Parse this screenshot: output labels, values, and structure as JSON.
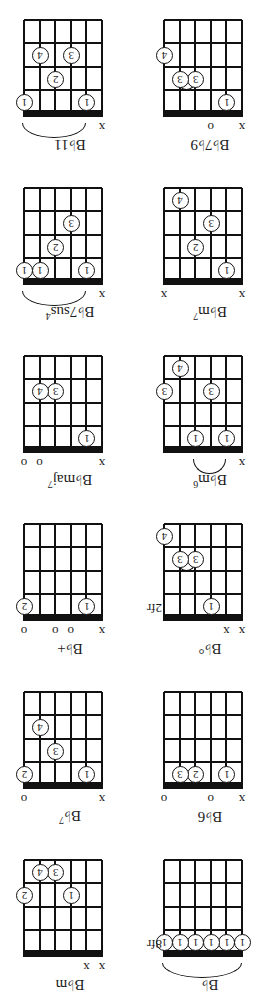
{
  "chords": [
    {
      "name": "B♭",
      "sup": "",
      "fret_label": "8fr",
      "marks": [
        "",
        "",
        "",
        "",
        "",
        ""
      ],
      "dots": [
        {
          "s": 6,
          "f": 1,
          "n": "1"
        },
        {
          "s": 5,
          "f": 1,
          "n": "1"
        },
        {
          "s": 4,
          "f": 1,
          "n": "1"
        },
        {
          "s": 3,
          "f": 1,
          "n": "1"
        },
        {
          "s": 2,
          "f": 1,
          "n": "1"
        },
        {
          "s": 1,
          "f": 1,
          "n": "1"
        }
      ],
      "barre": {
        "from": 6,
        "to": 1
      }
    },
    {
      "name": "B♭m",
      "sup": "",
      "fret_label": "",
      "marks": [
        "x",
        "x",
        "",
        "",
        "",
        ""
      ],
      "dots": [
        {
          "s": 4,
          "f": 3,
          "n": "1"
        },
        {
          "s": 1,
          "f": 3,
          "n": "2"
        },
        {
          "s": 3,
          "f": 4,
          "n": "3"
        },
        {
          "s": 2,
          "f": 4,
          "n": "4"
        }
      ]
    },
    {
      "name": "B♭6",
      "sup": "",
      "fret_label": "",
      "marks": [
        "x",
        "",
        "o",
        "",
        "",
        "o"
      ],
      "dots": [
        {
          "s": 5,
          "f": 1,
          "n": "1"
        },
        {
          "s": 3,
          "f": 1,
          "n": "2"
        },
        {
          "s": 2,
          "f": 1,
          "n": "3"
        }
      ]
    },
    {
      "name": "B♭",
      "sup": "7",
      "fret_label": "",
      "marks": [
        "x",
        "",
        "",
        "",
        "",
        "o"
      ],
      "dots": [
        {
          "s": 5,
          "f": 1,
          "n": "1"
        },
        {
          "s": 1,
          "f": 1,
          "n": "2"
        },
        {
          "s": 3,
          "f": 2,
          "n": "3"
        },
        {
          "s": 2,
          "f": 3,
          "n": "4"
        }
      ]
    },
    {
      "name": "B♭°",
      "sup": "",
      "fret_label": "2fr",
      "marks": [
        "x",
        "x",
        "",
        "",
        "",
        ""
      ],
      "dots": [
        {
          "s": 4,
          "f": 1,
          "n": "1"
        },
        {
          "s": 3,
          "f": 3,
          "n": "3"
        },
        {
          "s": 2,
          "f": 3,
          "n": "3"
        },
        {
          "s": 1,
          "f": 4,
          "n": "4"
        }
      ],
      "tie": {
        "from": 3,
        "to": 2,
        "f": 3
      }
    },
    {
      "name": "B♭+",
      "sup": "",
      "fret_label": "",
      "marks": [
        "x",
        "",
        "o",
        "o",
        "",
        "o"
      ],
      "dots": [
        {
          "s": 5,
          "f": 1,
          "n": "1"
        },
        {
          "s": 1,
          "f": 1,
          "n": "2"
        }
      ]
    },
    {
      "name": "B♭m",
      "sup": "6",
      "fret_label": "",
      "marks": [
        "x",
        "",
        "",
        "",
        "",
        ""
      ],
      "dots": [
        {
          "s": 5,
          "f": 1,
          "n": "1"
        },
        {
          "s": 3,
          "f": 1,
          "n": "1"
        },
        {
          "s": 4,
          "f": 3,
          "n": "3"
        },
        {
          "s": 1,
          "f": 3,
          "n": "3"
        },
        {
          "s": 2,
          "f": 4,
          "n": "4"
        }
      ],
      "barre": {
        "from": 5,
        "to": 3
      }
    },
    {
      "name": "B♭maj",
      "sup": "7",
      "fret_label": "",
      "marks": [
        "x",
        "",
        "",
        "",
        "o",
        "o"
      ],
      "dots": [
        {
          "s": 5,
          "f": 1,
          "n": "1"
        },
        {
          "s": 3,
          "f": 3,
          "n": "3"
        },
        {
          "s": 2,
          "f": 3,
          "n": "4"
        }
      ]
    },
    {
      "name": "B♭m",
      "sup": "7",
      "fret_label": "",
      "marks": [
        "x",
        "",
        "",
        "",
        "",
        "x"
      ],
      "dots": [
        {
          "s": 5,
          "f": 1,
          "n": "1"
        },
        {
          "s": 3,
          "f": 2,
          "n": "2"
        },
        {
          "s": 4,
          "f": 3,
          "n": "3"
        },
        {
          "s": 2,
          "f": 4,
          "n": "4"
        }
      ]
    },
    {
      "name": "B♭7sus",
      "sup": "4",
      "fret_label": "",
      "marks": [
        "x",
        "",
        "",
        "",
        "",
        ""
      ],
      "dots": [
        {
          "s": 5,
          "f": 1,
          "n": "1"
        },
        {
          "s": 2,
          "f": 1,
          "n": "1"
        },
        {
          "s": 1,
          "f": 1,
          "n": "1"
        },
        {
          "s": 3,
          "f": 2,
          "n": "2"
        },
        {
          "s": 4,
          "f": 3,
          "n": "3"
        }
      ],
      "barre": {
        "from": 5,
        "to": 1
      }
    },
    {
      "name": "B♭7♭9",
      "sup": "",
      "fret_label": "",
      "marks": [
        "x",
        "",
        "o",
        "",
        "",
        ""
      ],
      "dots": [
        {
          "s": 5,
          "f": 1,
          "n": "1"
        },
        {
          "s": 3,
          "f": 2,
          "n": "3"
        },
        {
          "s": 2,
          "f": 2,
          "n": "3"
        },
        {
          "s": 1,
          "f": 3,
          "n": "4"
        }
      ],
      "tie": {
        "from": 3,
        "to": 2,
        "f": 2
      }
    },
    {
      "name": "B♭11",
      "sup": "",
      "fret_label": "",
      "marks": [
        "x",
        "",
        "",
        "",
        "",
        ""
      ],
      "dots": [
        {
          "s": 5,
          "f": 1,
          "n": "1"
        },
        {
          "s": 1,
          "f": 1,
          "n": "1"
        },
        {
          "s": 3,
          "f": 2,
          "n": "2"
        },
        {
          "s": 4,
          "f": 3,
          "n": "3"
        },
        {
          "s": 2,
          "f": 3,
          "n": "4"
        }
      ],
      "barre": {
        "from": 5,
        "to": 1
      }
    }
  ]
}
